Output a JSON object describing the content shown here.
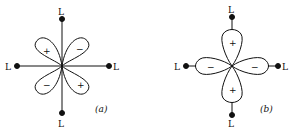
{
  "diagram_a": {
    "ligand_top": "L",
    "ligand_bottom": "L",
    "ligand_left": "L",
    "ligand_right": "L",
    "lobe_upper_left_sign": "+",
    "lobe_upper_right_sign": "−",
    "lobe_lower_left_sign": "−",
    "lobe_lower_right_sign": "+",
    "caption": "(a)"
  },
  "diagram_b": {
    "ligand_top": "L",
    "ligand_bottom": "L",
    "ligand_left": "L",
    "ligand_right": "L",
    "lobe_top_sign": "+",
    "lobe_bottom_sign": "+",
    "lobe_left_sign": "−",
    "lobe_right_sign": "−",
    "caption": "(b)"
  },
  "colors": {
    "ink": "#111111",
    "background": "#ffffff"
  }
}
